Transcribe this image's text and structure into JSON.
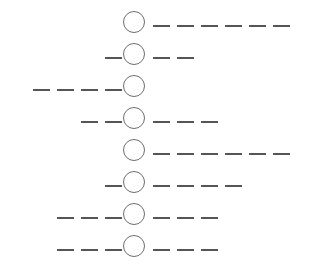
{
  "diagram": {
    "type": "dash-circle-sequence",
    "stroke_color": "#555555",
    "circle_color": "#6e6e6e",
    "circle_center_x": 134,
    "circle_radius": 11,
    "row_pitch": 32,
    "first_row_center_y": 22,
    "dash_width": 17,
    "dash_period": 24,
    "rows": [
      {
        "index": 1,
        "left_dashes": 0,
        "right_dashes": 6
      },
      {
        "index": 2,
        "left_dashes": 1,
        "right_dashes": 2
      },
      {
        "index": 3,
        "left_dashes": 4,
        "right_dashes": 0
      },
      {
        "index": 4,
        "left_dashes": 2,
        "right_dashes": 3
      },
      {
        "index": 5,
        "left_dashes": 0,
        "right_dashes": 6
      },
      {
        "index": 6,
        "left_dashes": 1,
        "right_dashes": 4
      },
      {
        "index": 7,
        "left_dashes": 3,
        "right_dashes": 3
      },
      {
        "index": 8,
        "left_dashes": 3,
        "right_dashes": 3
      }
    ]
  }
}
